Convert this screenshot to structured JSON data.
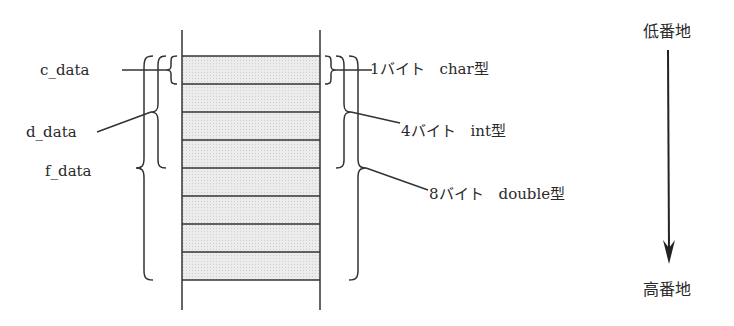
{
  "diagram": {
    "left_labels": [
      {
        "id": "c",
        "text": "c_data"
      },
      {
        "id": "d",
        "text": "d_data"
      },
      {
        "id": "f",
        "text": "f_data"
      }
    ],
    "right_labels": [
      {
        "id": "char",
        "text": "1バイト　char型",
        "bytes": 1,
        "type": "char"
      },
      {
        "id": "int",
        "text": "4バイト　int型",
        "bytes": 4,
        "type": "int"
      },
      {
        "id": "double",
        "text": "8バイト　double型",
        "bytes": 8,
        "type": "double"
      }
    ],
    "address": {
      "low": "低番地",
      "high": "高番地"
    },
    "memory_cells": 8,
    "colors": {
      "cell_fill": "#e4e4e4",
      "line": "#333333"
    }
  }
}
